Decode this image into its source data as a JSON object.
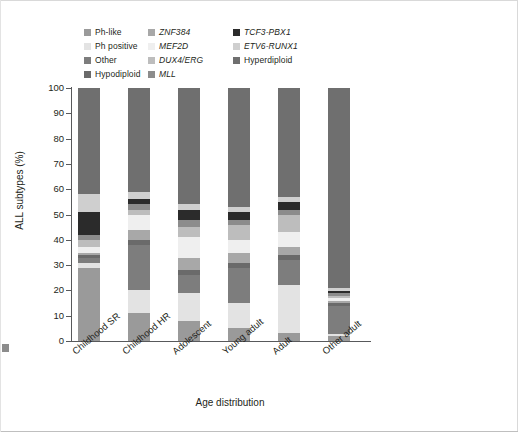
{
  "chart_data": {
    "type": "bar",
    "subtype": "stacked-percent",
    "title": "",
    "xlabel": "Age distribution",
    "ylabel": "ALL subtypes (%)",
    "ylim": [
      0,
      100
    ],
    "yticks": [
      0,
      10,
      20,
      30,
      40,
      50,
      60,
      70,
      80,
      90,
      100
    ],
    "grid": false,
    "legend_position": "top",
    "categories": [
      "Childhood SR",
      "Childhood HR",
      "Adolescent",
      "Young adult",
      "Adult",
      "Other adult"
    ],
    "series": [
      {
        "name": "Ph-like",
        "color": "#9a9a9a",
        "values": [
          29,
          11,
          8,
          5,
          3,
          2
        ]
      },
      {
        "name": "Ph positive",
        "color": "#e3e3e3",
        "values": [
          2,
          9,
          11,
          10,
          19,
          1
        ]
      },
      {
        "name": "Other",
        "color": "#7d7d7d",
        "values": [
          2,
          18,
          7,
          14,
          10,
          11
        ]
      },
      {
        "name": "Hypodiploid",
        "color": "#6a6a6a",
        "values": [
          1,
          2,
          2,
          2,
          2,
          1
        ]
      },
      {
        "name": "ZNF384",
        "color": "#a8a8a8",
        "values": [
          1,
          4,
          5,
          4,
          3,
          1
        ]
      },
      {
        "name": "MEF2D",
        "color": "#efefef",
        "values": [
          2,
          6,
          8,
          5,
          6,
          1
        ]
      },
      {
        "name": "DUX4/ERG",
        "color": "#bdbdbd",
        "values": [
          3,
          2,
          4,
          6,
          7,
          1
        ]
      },
      {
        "name": "MLL",
        "color": "#8c8c8c",
        "values": [
          2,
          2,
          3,
          2,
          2,
          1
        ]
      },
      {
        "name": "TCF3-PBX1",
        "color": "#2b2b2b",
        "values": [
          9,
          2,
          4,
          3,
          3,
          1
        ]
      },
      {
        "name": "ETV6-RUNX1",
        "color": "#cfcfcf",
        "values": [
          7,
          3,
          2,
          2,
          2,
          1
        ]
      },
      {
        "name": "Hyperdiploid",
        "color": "#6f6f6f",
        "values": [
          42,
          41,
          46,
          47,
          43,
          80
        ]
      }
    ]
  },
  "legend": {
    "columns": [
      {
        "items": [
          {
            "label": "Ph-like",
            "italic": false,
            "swatch": "#9a9a9a"
          },
          {
            "label": "Ph positive",
            "italic": false,
            "swatch": "#e3e3e3"
          },
          {
            "label": "Other",
            "italic": false,
            "swatch": "#7d7d7d"
          },
          {
            "label": "Hypodiploid",
            "italic": false,
            "swatch": "#6a6a6a"
          }
        ]
      },
      {
        "items": [
          {
            "label": "ZNF384",
            "italic": true,
            "swatch": "#a8a8a8"
          },
          {
            "label": "MEF2D",
            "italic": true,
            "swatch": "#efefef"
          },
          {
            "label": "DUX4/ERG",
            "italic": true,
            "swatch": "#bdbdbd"
          },
          {
            "label": "MLL",
            "italic": true,
            "swatch": "#8c8c8c"
          }
        ]
      },
      {
        "items": [
          {
            "label": "TCF3-PBX1",
            "italic": true,
            "swatch": "#2b2b2b"
          },
          {
            "label": "ETV6-RUNX1",
            "italic": true,
            "swatch": "#cfcfcf"
          },
          {
            "label": "Hyperdiploid",
            "italic": false,
            "swatch": "#6f6f6f"
          }
        ]
      }
    ]
  },
  "axis_colors": {
    "line": "#58595b",
    "text": "#231f20"
  }
}
